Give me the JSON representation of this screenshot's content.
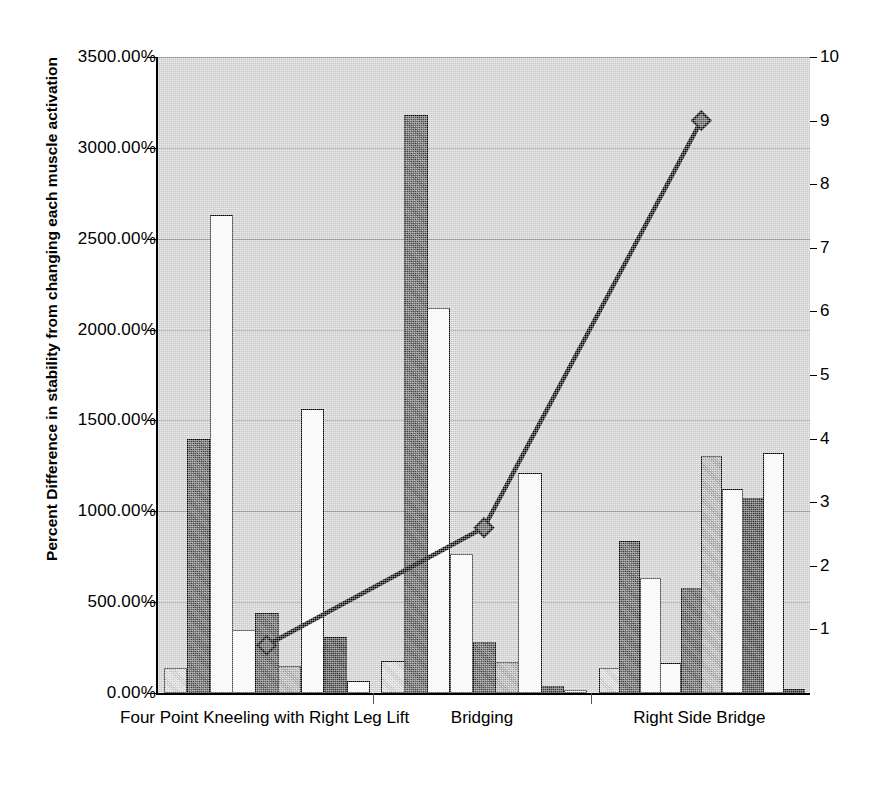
{
  "chart_data": {
    "type": "bar",
    "title": "",
    "xlabel": "",
    "ylabel": "Percent Difference in stability from changing each muscle activation",
    "y2label": "",
    "categories": [
      "Four Point Kneeling with Right Leg Lift",
      "Bridging",
      "Right Side Bridge"
    ],
    "ylim": [
      0,
      3500
    ],
    "y2lim": [
      0,
      10
    ],
    "ytick_labels": [
      "0.00%",
      "500.00%",
      "1000.00%",
      "1500.00%",
      "2000.00%",
      "2500.00%",
      "3000.00%",
      "3500.00%"
    ],
    "ytick_values": [
      0,
      500,
      1000,
      1500,
      2000,
      2500,
      3000,
      3500
    ],
    "y2tick_labels": [
      "0",
      "1",
      "2",
      "3",
      "4",
      "5",
      "6",
      "7",
      "8",
      "9",
      "10"
    ],
    "y2tick_values": [
      0,
      1,
      2,
      3,
      4,
      5,
      6,
      7,
      8,
      9,
      10
    ],
    "grid": true,
    "legend": "none",
    "bar_series_count": 9,
    "groups": [
      {
        "category": "Four Point Kneeling with Right Leg Lift",
        "values": [
          135,
          1400,
          2630,
          345,
          440,
          150,
          1565,
          310,
          65
        ]
      },
      {
        "category": "Bridging",
        "values": [
          175,
          3180,
          2120,
          765,
          280,
          170,
          1210,
          40,
          15
        ]
      },
      {
        "category": "Right Side Bridge",
        "values": [
          140,
          835,
          635,
          165,
          580,
          1305,
          1125,
          1075,
          1320,
          20
        ]
      }
    ],
    "line_series": {
      "name": "secondary-axis-line",
      "axis": "right",
      "values": [
        0.75,
        2.6,
        9.0
      ],
      "marker": "diamond",
      "color": "#000000"
    }
  },
  "axis": {
    "left_title": "Percent Difference in stability from changing each muscle activation"
  }
}
